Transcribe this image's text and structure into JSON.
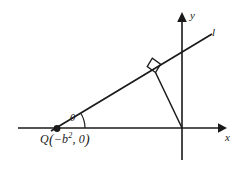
{
  "figure": {
    "type": "geometry-diagram",
    "background_color": "#ffffff",
    "stroke_color": "#1a1a1a",
    "labels": {
      "y_axis": "y",
      "x_axis": "x",
      "line": "l",
      "angle": "θ",
      "point_q_name": "Q",
      "point_q_open_paren": "(",
      "point_q_coord_x_base": "−b",
      "point_q_coord_x_exponent": "2",
      "point_q_comma": ", ",
      "point_q_coord_y": "0",
      "point_q_close_paren": ")"
    },
    "elements": {
      "x_axis": {
        "name": "x-axis",
        "from": [
          18,
          128
        ],
        "to": [
          225,
          128
        ],
        "arrow": "right"
      },
      "y_axis": {
        "name": "y-axis",
        "from": [
          182,
          160
        ],
        "to": [
          182,
          14
        ],
        "arrow": "up"
      },
      "line_l": {
        "name": "line-l",
        "from": [
          53,
          130
        ],
        "to": [
          211,
          35
        ]
      },
      "perpendicular": {
        "name": "perpendicular-segment",
        "from": [
          182,
          128
        ],
        "to": [
          155,
          72
        ]
      },
      "right_angle_marker": {
        "name": "right-angle-marker",
        "at": [
          155,
          72
        ]
      },
      "angle_arc": {
        "name": "angle-arc",
        "vertex": [
          57,
          128
        ],
        "radius": 26
      },
      "point_q": {
        "name": "point-q-dot",
        "at": [
          57,
          128
        ],
        "radius": 3
      },
      "origin": {
        "name": "origin",
        "at": [
          182,
          128
        ]
      }
    }
  }
}
